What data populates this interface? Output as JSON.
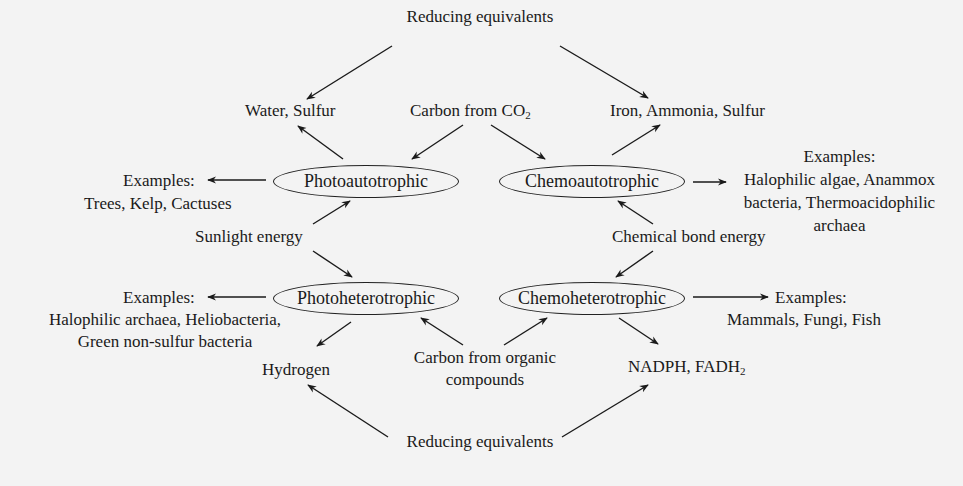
{
  "diagram": {
    "type": "nutritional-modes-flow",
    "nodes": {
      "photoautotrophic": "Photoautotrophic",
      "chemoautotrophic": "Chemoautotrophic",
      "photoheterotrophic": "Photoheterotrophic",
      "chemoheterotrophic": "Chemoheterotrophic"
    },
    "sources": {
      "reducing_top": "Reducing equivalents",
      "reducing_bottom": "Reducing equivalents",
      "carbon_co2_prefix": "Carbon from CO",
      "carbon_co2_sub": "2",
      "carbon_organic_line1": "Carbon from organic",
      "carbon_organic_line2": "compounds",
      "sunlight": "Sunlight energy",
      "chemical": "Chemical bond energy"
    },
    "electron_donors": {
      "photoautotrophic": "Water, Sulfur",
      "chemoautotrophic": "Iron, Ammonia, Sulfur",
      "photoheterotrophic": "Hydrogen",
      "chemoheterotrophic_prefix": "NADPH, FADH",
      "chemoheterotrophic_sub": "2"
    },
    "examples": {
      "photoautotrophic": {
        "label": "Examples:",
        "lines": [
          "Trees, Kelp, Cactuses"
        ]
      },
      "chemoautotrophic": {
        "label": "Examples:",
        "lines": [
          "Halophilic algae, Anammox",
          "bacteria, Thermoacidophilic",
          "archaea"
        ]
      },
      "photoheterotrophic": {
        "label": "Examples:",
        "lines": [
          "Halophilic archaea, Heliobacteria,",
          "Green non-sulfur bacteria"
        ]
      },
      "chemoheterotrophic": {
        "label": "Examples:",
        "lines": [
          "Mammals, Fungi, Fish"
        ]
      }
    },
    "edges": [
      [
        "Reducing equivalents (top)",
        "Water, Sulfur"
      ],
      [
        "Reducing equivalents (top)",
        "Iron, Ammonia, Sulfur"
      ],
      [
        "Photoautotrophic",
        "Water, Sulfur"
      ],
      [
        "Carbon from CO2",
        "Photoautotrophic"
      ],
      [
        "Carbon from CO2",
        "Chemoautotrophic"
      ],
      [
        "Chemoautotrophic",
        "Iron, Ammonia, Sulfur"
      ],
      [
        "Photoautotrophic",
        "Examples (Trees, Kelp, Cactuses)"
      ],
      [
        "Chemoautotrophic",
        "Examples (Halophilic algae...)"
      ],
      [
        "Sunlight energy",
        "Photoautotrophic"
      ],
      [
        "Sunlight energy",
        "Photoheterotrophic"
      ],
      [
        "Chemical bond energy",
        "Chemoautotrophic"
      ],
      [
        "Chemical bond energy",
        "Chemoheterotrophic"
      ],
      [
        "Photoheterotrophic",
        "Examples (Halophilic archaea...)"
      ],
      [
        "Chemoheterotrophic",
        "Examples (Mammals, Fungi, Fish)"
      ],
      [
        "Photoheterotrophic",
        "Hydrogen"
      ],
      [
        "Carbon from organic compounds",
        "Photoheterotrophic"
      ],
      [
        "Carbon from organic compounds",
        "Chemoheterotrophic"
      ],
      [
        "Chemoheterotrophic",
        "NADPH, FADH2"
      ],
      [
        "Reducing equivalents (bottom)",
        "Hydrogen"
      ],
      [
        "Reducing equivalents (bottom)",
        "NADPH, FADH2"
      ]
    ]
  }
}
